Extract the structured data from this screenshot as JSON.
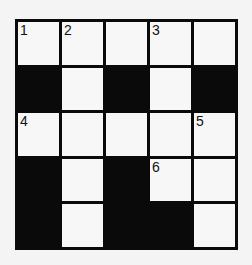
{
  "puzzle": {
    "rows": 5,
    "cols": 5,
    "cells": [
      [
        {
          "black": false,
          "num": "1"
        },
        {
          "black": false,
          "num": "2"
        },
        {
          "black": false,
          "num": ""
        },
        {
          "black": false,
          "num": "3"
        },
        {
          "black": false,
          "num": ""
        }
      ],
      [
        {
          "black": true,
          "num": ""
        },
        {
          "black": false,
          "num": ""
        },
        {
          "black": true,
          "num": ""
        },
        {
          "black": false,
          "num": ""
        },
        {
          "black": true,
          "num": ""
        }
      ],
      [
        {
          "black": false,
          "num": "4"
        },
        {
          "black": false,
          "num": ""
        },
        {
          "black": false,
          "num": ""
        },
        {
          "black": false,
          "num": ""
        },
        {
          "black": false,
          "num": "5"
        }
      ],
      [
        {
          "black": true,
          "num": ""
        },
        {
          "black": false,
          "num": ""
        },
        {
          "black": true,
          "num": ""
        },
        {
          "black": false,
          "num": "6"
        },
        {
          "black": false,
          "num": ""
        }
      ],
      [
        {
          "black": true,
          "num": ""
        },
        {
          "black": false,
          "num": ""
        },
        {
          "black": true,
          "num": ""
        },
        {
          "black": true,
          "num": ""
        },
        {
          "black": false,
          "num": ""
        }
      ]
    ]
  },
  "colors": {
    "black_cell": "#0a0a0a",
    "white_cell": "#f7f7f7",
    "background": "#f4f4f4"
  }
}
